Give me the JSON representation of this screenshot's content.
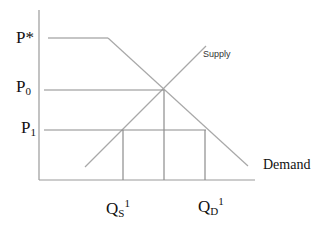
{
  "diagram": {
    "type": "supply-demand",
    "price_labels": {
      "p_star": {
        "main": "P",
        "mark": "*"
      },
      "p0": {
        "main": "P",
        "sub": "0"
      },
      "p1": {
        "main": "P",
        "sub": "1"
      }
    },
    "quantity_labels": {
      "qs1": {
        "main": "Q",
        "sub": "S",
        "sup": "1"
      },
      "qd1": {
        "main": "Q",
        "sub": "D",
        "sup": "1"
      }
    },
    "curve_labels": {
      "supply": "Supply",
      "demand": "Demand"
    },
    "colors": {
      "axis": "#9a9a9a",
      "curve": "#a8a8a8",
      "guide": "#8c8c8c",
      "text": "#111111"
    }
  }
}
